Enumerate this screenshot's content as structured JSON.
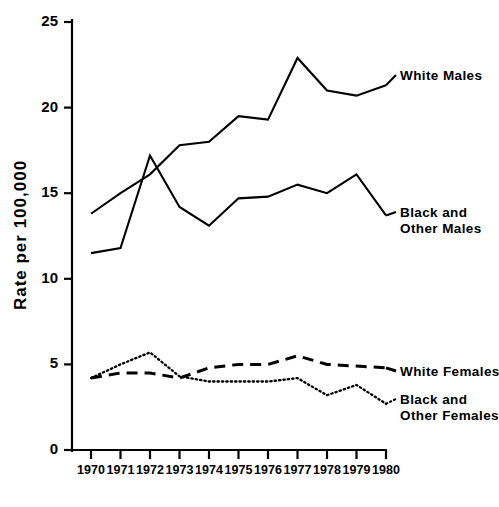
{
  "chart_data": {
    "type": "line",
    "title": "",
    "xlabel": "",
    "ylabel": "Rate per 100,000",
    "x": [
      1970,
      1971,
      1972,
      1973,
      1974,
      1975,
      1976,
      1977,
      1978,
      1979,
      1980
    ],
    "xtick_labels": [
      "1970",
      "1971",
      "1972",
      "1973",
      "1974",
      "1975",
      "1976",
      "1977",
      "1978",
      "1979",
      "1980"
    ],
    "ytick_labels": [
      "0",
      "5",
      "10",
      "15",
      "20",
      "25"
    ],
    "yticks": [
      0,
      5,
      10,
      15,
      20,
      25
    ],
    "ylim": [
      0,
      25
    ],
    "xlim": [
      1970,
      1980
    ],
    "grid": false,
    "legend_position": "right-inline-end-of-line",
    "series": [
      {
        "name": "White Males",
        "style": "solid",
        "color": "#000000",
        "values": [
          13.8,
          15.0,
          16.1,
          17.8,
          18.0,
          19.5,
          19.3,
          22.9,
          21.0,
          20.7,
          21.3
        ],
        "label_lines": [
          "White Males"
        ]
      },
      {
        "name": "Black and Other Males",
        "style": "solid",
        "color": "#000000",
        "values": [
          11.5,
          11.8,
          17.2,
          14.2,
          13.1,
          14.7,
          14.8,
          15.5,
          15.0,
          16.1,
          13.7
        ],
        "label_lines": [
          "Black and",
          "Other Males"
        ]
      },
      {
        "name": "White Females",
        "style": "dashed",
        "color": "#000000",
        "values": [
          4.2,
          4.5,
          4.5,
          4.2,
          4.8,
          5.0,
          5.0,
          5.5,
          5.0,
          4.9,
          4.8
        ],
        "label_lines": [
          "White Females"
        ]
      },
      {
        "name": "Black and Other Females",
        "style": "dotted",
        "color": "#000000",
        "values": [
          4.2,
          5.0,
          5.7,
          4.3,
          4.0,
          4.0,
          4.0,
          4.2,
          3.2,
          3.8,
          2.7
        ],
        "label_lines": [
          "Black and",
          "Other Females"
        ]
      }
    ]
  },
  "labels": {
    "y_axis_title": "Rate per 100,000",
    "legend_white_males": "White Males",
    "legend_black_other_males_1": "Black and",
    "legend_black_other_males_2": "Other Males",
    "legend_white_females": "White Females",
    "legend_black_other_females_1": "Black and",
    "legend_black_other_females_2": "Other Females"
  },
  "ytick_text": {
    "t0": "0",
    "t5": "5",
    "t10": "10",
    "t15": "15",
    "t20": "20",
    "t25": "25"
  },
  "xtick_text": {
    "y1970": "1970",
    "y1971": "1971",
    "y1972": "1972",
    "y1973": "1973",
    "y1974": "1974",
    "y1975": "1975",
    "y1976": "1976",
    "y1977": "1977",
    "y1978": "1978",
    "y1979": "1979",
    "y1980": "1980"
  }
}
